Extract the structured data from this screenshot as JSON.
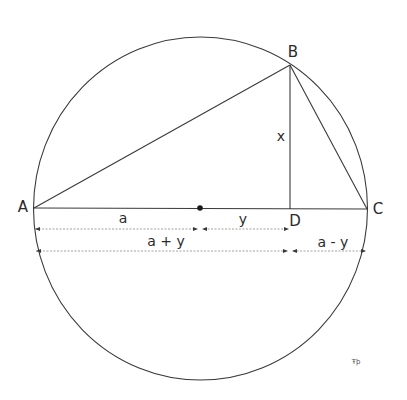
{
  "diagram": {
    "type": "geometry",
    "points": {
      "A": {
        "label": "A",
        "x": 34,
        "y": 208
      },
      "B": {
        "label": "B",
        "x": 290,
        "y": 65
      },
      "C": {
        "label": "C",
        "x": 367,
        "y": 209
      },
      "D": {
        "label": "D",
        "x": 290,
        "y": 209
      },
      "O": {
        "label": "",
        "x": 200,
        "y": 208
      }
    },
    "circle": {
      "cx": 200.5,
      "cy": 208.5,
      "rx": 167,
      "ry": 171.5
    },
    "segment_labels": {
      "x": "x",
      "a": "a",
      "y": "y",
      "a_plus_y": "a + y",
      "a_minus_y": "a - y"
    },
    "colors": {
      "stroke": "#3a3a3a",
      "dimension": "#8a8a8a",
      "text": "#2a2a2a"
    },
    "watermark": "Ŧþ"
  }
}
